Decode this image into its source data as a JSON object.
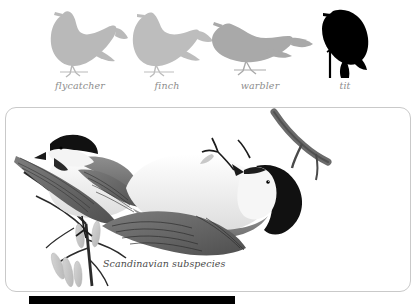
{
  "page": {
    "background_color": "#ffffff",
    "type": "field-guide-plate"
  },
  "silhouettes": {
    "label_color": "#8d8d8d",
    "items": [
      {
        "label": "flycatcher",
        "icon": "bird-silhouette-flycatcher",
        "color": "#b9b9b9",
        "posture": "upright",
        "x": 30,
        "width": 100
      },
      {
        "label": "finch",
        "icon": "bird-silhouette-finch",
        "color": "#bdbdbd",
        "posture": "upright-stocky",
        "x": 120,
        "width": 96
      },
      {
        "label": "warbler",
        "icon": "bird-silhouette-warbler",
        "color": "#a9a9a9",
        "posture": "horizontal",
        "x": 206,
        "width": 110
      },
      {
        "label": "tit",
        "icon": "bird-silhouette-tit",
        "color": "#000000",
        "posture": "clinging-vertical",
        "x": 305,
        "width": 80
      }
    ]
  },
  "plate": {
    "caption": "Scandinavian subspecies",
    "border_color": "#c9c9c9",
    "illustrations": [
      {
        "name": "willow-tit-perched",
        "position": "left",
        "description": "tit perched on twig with catkins"
      },
      {
        "name": "willow-tit-hanging",
        "position": "right",
        "description": "tit hanging upside down from branch"
      }
    ]
  },
  "bottom_bar": {
    "color": "#000000"
  }
}
